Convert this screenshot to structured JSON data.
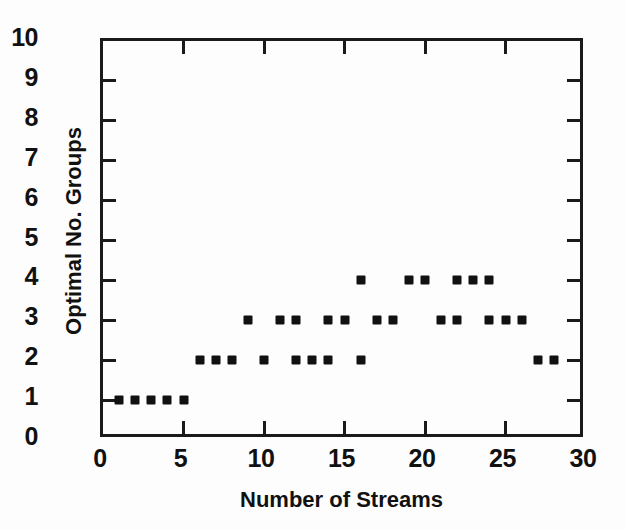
{
  "chart_data": {
    "type": "scatter",
    "title": "",
    "xlabel": "Number of Streams",
    "ylabel": "Optimal No. Groups",
    "xlim": [
      0,
      30
    ],
    "ylim": [
      0,
      10
    ],
    "xticks": [
      0,
      5,
      10,
      15,
      20,
      25,
      30
    ],
    "yticks": [
      0,
      1,
      2,
      3,
      4,
      5,
      6,
      7,
      8,
      9,
      10
    ],
    "xtick_labels": [
      "0",
      "5",
      "10",
      "15",
      "20",
      "25",
      "30"
    ],
    "ytick_labels": [
      "0",
      "1",
      "2",
      "3",
      "4",
      "5",
      "6",
      "7",
      "8",
      "9",
      "10"
    ],
    "grid": false,
    "legend": null,
    "marker": "square-dot",
    "marker_color": "#111111",
    "points": [
      {
        "x": 1,
        "y": 1
      },
      {
        "x": 2,
        "y": 1
      },
      {
        "x": 3,
        "y": 1
      },
      {
        "x": 4,
        "y": 1
      },
      {
        "x": 5,
        "y": 1
      },
      {
        "x": 6,
        "y": 2
      },
      {
        "x": 7,
        "y": 2
      },
      {
        "x": 8,
        "y": 2
      },
      {
        "x": 10,
        "y": 2
      },
      {
        "x": 12,
        "y": 2
      },
      {
        "x": 13,
        "y": 2
      },
      {
        "x": 14,
        "y": 2
      },
      {
        "x": 16,
        "y": 2
      },
      {
        "x": 27,
        "y": 2
      },
      {
        "x": 28,
        "y": 2
      },
      {
        "x": 9,
        "y": 3
      },
      {
        "x": 11,
        "y": 3
      },
      {
        "x": 12,
        "y": 3
      },
      {
        "x": 14,
        "y": 3
      },
      {
        "x": 15,
        "y": 3
      },
      {
        "x": 17,
        "y": 3
      },
      {
        "x": 18,
        "y": 3
      },
      {
        "x": 21,
        "y": 3
      },
      {
        "x": 22,
        "y": 3
      },
      {
        "x": 24,
        "y": 3
      },
      {
        "x": 25,
        "y": 3
      },
      {
        "x": 26,
        "y": 3
      },
      {
        "x": 16,
        "y": 4
      },
      {
        "x": 19,
        "y": 4
      },
      {
        "x": 20,
        "y": 4
      },
      {
        "x": 22,
        "y": 4
      },
      {
        "x": 23,
        "y": 4
      },
      {
        "x": 24,
        "y": 4
      }
    ]
  }
}
